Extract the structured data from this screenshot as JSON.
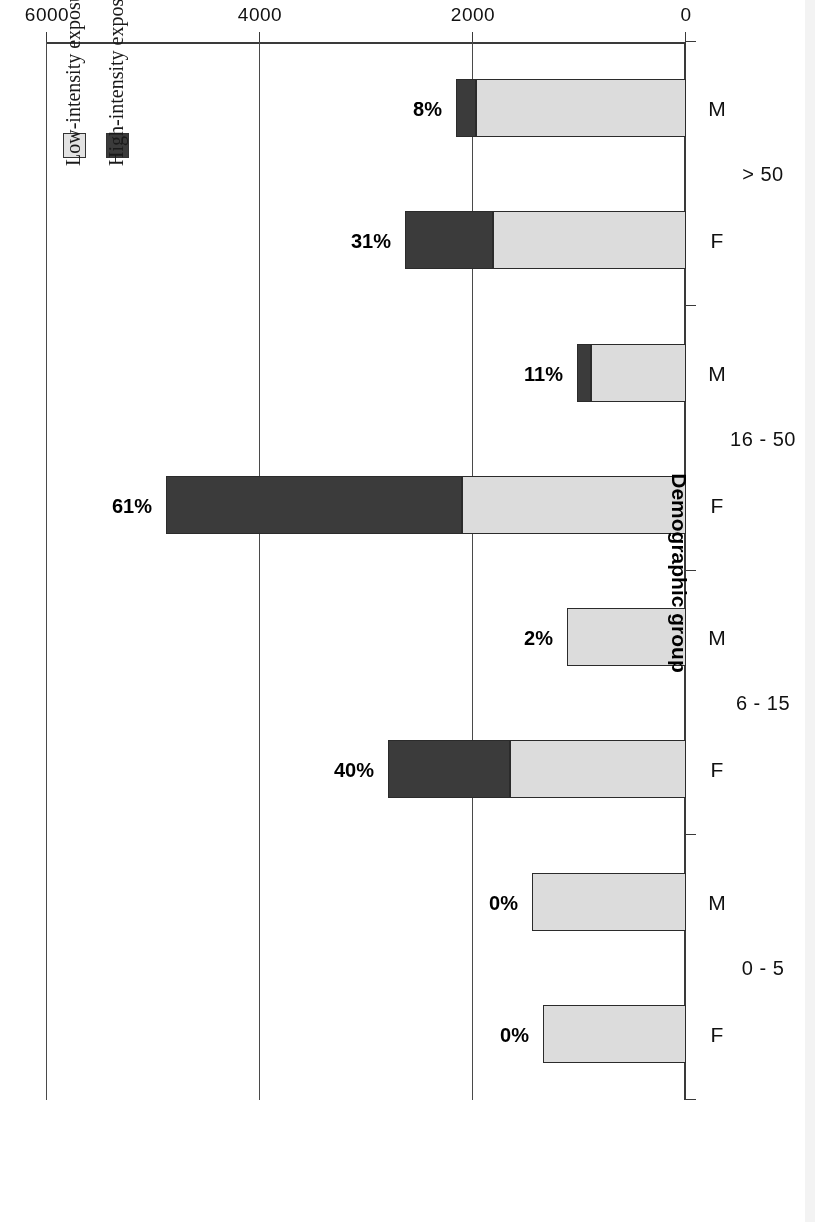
{
  "chart_data": {
    "type": "bar",
    "orientation": "horizontal",
    "title": "",
    "xlabel": "Demographic group",
    "ylabel": "PM10 exposure concentration (µg / m³)",
    "ylabel_parts": {
      "prefix": "PM",
      "sub": "10",
      "middle": " exposure concentration (µg / m",
      "sup": "3",
      "suffix": ")"
    },
    "value_axis_ticks": [
      "0",
      "2000",
      "4000",
      "6000"
    ],
    "value_axis_tick_values": [
      0,
      2000,
      4000,
      6000
    ],
    "ylim": [
      0,
      6000
    ],
    "grid": true,
    "stacked": true,
    "legend_position": "inside-upper-left",
    "categories": [
      "F",
      "M",
      "F",
      "M",
      "F",
      "M",
      "F",
      "M"
    ],
    "groups": [
      {
        "label": "0 - 5",
        "members": [
          "F",
          "M"
        ]
      },
      {
        "label": "6 - 15",
        "members": [
          "F",
          "M"
        ]
      },
      {
        "label": "16 - 50",
        "members": [
          "F",
          "M"
        ]
      },
      {
        "label": "> 50",
        "members": [
          "F",
          "M"
        ]
      }
    ],
    "series": [
      {
        "name": "High-intensity exposure",
        "color": "#3b3b3b",
        "values": [
          0,
          0,
          1145,
          0,
          2780,
          131,
          826,
          188
        ]
      },
      {
        "name": "Low-intensity exposure",
        "color": "#dcdcdc",
        "values": [
          1343,
          1446,
          1653,
          1117,
          2103,
          892,
          1812,
          1972
        ]
      }
    ],
    "totals": [
      1343,
      1446,
      2798,
      1117,
      4883,
      1023,
      2638,
      2160
    ],
    "bar_labels": [
      "0%",
      "0%",
      "40%",
      "2%",
      "61%",
      "11%",
      "31%",
      "8%"
    ],
    "legend_entries": [
      {
        "label": "High-intensity exposure",
        "swatch": "high"
      },
      {
        "label": "Low-intensity exposure",
        "swatch": "low"
      }
    ]
  },
  "figure": {
    "rotation_note": "180",
    "accent_dark": "#3b3b3b",
    "accent_light": "#dcdcdc",
    "axis_color": "#3a3a3a"
  }
}
